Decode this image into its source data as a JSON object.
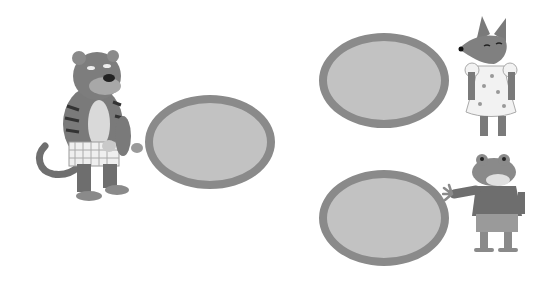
{
  "scene": {
    "background": "#ffffff",
    "bubble_fill": "#c2c2c2",
    "bubble_border": "#8a8a8a",
    "characters": [
      {
        "name": "tiger",
        "description": "tiger in checkered shorts"
      },
      {
        "name": "fox",
        "description": "fox in polka-dot dress"
      },
      {
        "name": "frog",
        "description": "frog in sweater reaching out"
      }
    ],
    "bubbles": [
      {
        "id": "tiger-bubble",
        "text": ""
      },
      {
        "id": "fox-bubble",
        "text": ""
      },
      {
        "id": "frog-bubble",
        "text": ""
      }
    ]
  }
}
